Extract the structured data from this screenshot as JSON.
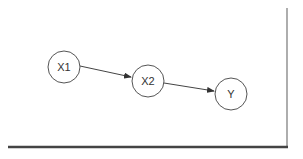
{
  "diagram": {
    "type": "directed-graph",
    "nodes": [
      {
        "id": "X1",
        "label": "X1",
        "cx": 64,
        "cy": 67,
        "r": 16
      },
      {
        "id": "X2",
        "label": "X2",
        "cx": 148,
        "cy": 81,
        "r": 16
      },
      {
        "id": "Y",
        "label": "Y",
        "cx": 231,
        "cy": 94,
        "r": 16
      }
    ],
    "edges": [
      {
        "from": "X1",
        "to": "X2"
      },
      {
        "from": "X2",
        "to": "Y"
      }
    ],
    "colors": {
      "node_stroke": "#555555",
      "edge": "#444444",
      "frame": "#444444",
      "background": "#ffffff"
    }
  }
}
